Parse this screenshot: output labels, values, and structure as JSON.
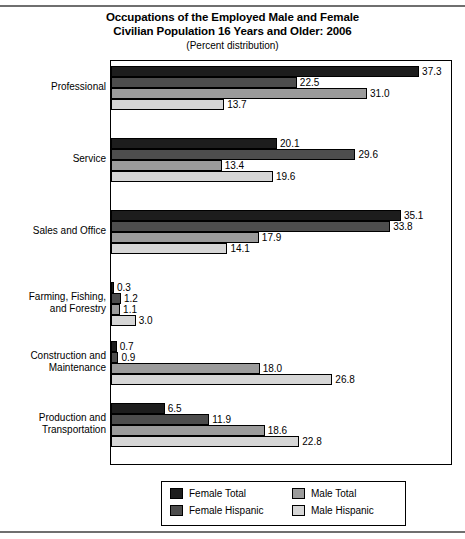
{
  "title": {
    "line1": "Occupations of the Employed Male and Female",
    "line2": "Civilian Population 16 Years and Older: 2006",
    "subtitle": "(Percent distribution)"
  },
  "legend": {
    "items": [
      {
        "label": "Female Total",
        "color": "#1d1d1d"
      },
      {
        "label": "Male Total",
        "color": "#9b9b9b"
      },
      {
        "label": "Female Hispanic",
        "color": "#4d4d4d"
      },
      {
        "label": "Male Hispanic",
        "color": "#d6d6d6"
      }
    ]
  },
  "chart_data": {
    "type": "bar",
    "orientation": "horizontal",
    "title": "Occupations of the Employed Male and Female Civilian Population 16 Years and Older: 2006",
    "subtitle": "(Percent distribution)",
    "xlabel": "",
    "ylabel": "",
    "xlim": [
      0,
      41.4
    ],
    "grid": false,
    "legend_position": "bottom",
    "value_labels": true,
    "categories": [
      "Professional",
      "Service",
      "Sales and Office",
      "Farming, Fishing,\nand Forestry",
      "Construction and\nMaintenance",
      "Production and\nTransportation"
    ],
    "series": [
      {
        "name": "Female Total",
        "color": "#1d1d1d",
        "values": [
          37.3,
          20.1,
          35.1,
          0.3,
          0.7,
          6.5
        ]
      },
      {
        "name": "Female Hispanic",
        "color": "#4d4d4d",
        "values": [
          22.5,
          29.6,
          33.8,
          1.2,
          0.9,
          11.9
        ]
      },
      {
        "name": "Male Total",
        "color": "#9b9b9b",
        "values": [
          31.0,
          13.4,
          17.9,
          1.1,
          18.0,
          18.6
        ]
      },
      {
        "name": "Male Hispanic",
        "color": "#d6d6d6",
        "values": [
          13.7,
          19.6,
          14.1,
          3.0,
          26.8,
          22.8
        ]
      }
    ],
    "labels": {
      "Professional": [
        "37.3",
        "22.5",
        "31.0",
        "13.7"
      ],
      "Service": [
        "20.1",
        "29.6",
        "13.4",
        "19.6"
      ],
      "Sales and Office": [
        "35.1",
        "33.8",
        "17.9",
        "14.1"
      ],
      "Farming": [
        "0.3",
        "1.2",
        "1.1",
        "3.0"
      ],
      "Construction": [
        "0.7",
        "0.9",
        "18.0",
        "26.8"
      ],
      "Production": [
        "6.5",
        "11.9",
        "18.6",
        "22.8"
      ]
    }
  },
  "category_lines": [
    [
      "Professional"
    ],
    [
      "Service"
    ],
    [
      "Sales and Office"
    ],
    [
      "Farming, Fishing,",
      "and Forestry"
    ],
    [
      "Construction and",
      "Maintenance"
    ],
    [
      "Production and",
      "Transportation"
    ]
  ]
}
